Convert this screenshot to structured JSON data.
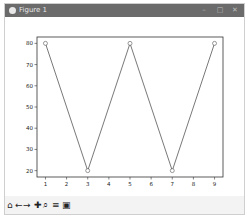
{
  "window": {
    "title": "Figure 1",
    "minimize_label": "–",
    "maximize_label": "□",
    "close_label": "✕"
  },
  "toolbar": {
    "items": [
      {
        "name": "home-icon",
        "glyph": "⌂"
      },
      {
        "name": "back-icon",
        "glyph": "←"
      },
      {
        "name": "forward-icon",
        "glyph": "→"
      },
      {
        "name": "pan-icon",
        "glyph": "✚"
      },
      {
        "name": "zoom-icon",
        "glyph": "⌕"
      },
      {
        "name": "subplots-icon",
        "glyph": "≡"
      },
      {
        "name": "save-icon",
        "glyph": "▣"
      }
    ]
  },
  "chart_data": {
    "type": "line",
    "title": "",
    "xlabel": "",
    "ylabel": "",
    "x": [
      1,
      3,
      5,
      7,
      9
    ],
    "series": [
      {
        "name": "",
        "values": [
          80,
          20,
          80,
          20,
          80
        ],
        "color": "#555555",
        "marker": "o"
      }
    ],
    "xticks": [
      1,
      2,
      3,
      4,
      5,
      6,
      7,
      8,
      9
    ],
    "yticks": [
      20,
      30,
      40,
      50,
      60,
      70,
      80
    ],
    "xlim": [
      0.6,
      9.4
    ],
    "ylim": [
      17,
      83
    ],
    "grid": false,
    "legend": null
  }
}
